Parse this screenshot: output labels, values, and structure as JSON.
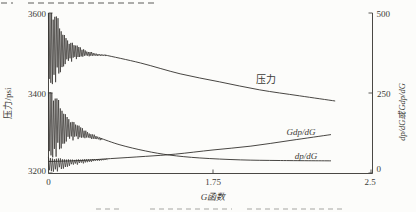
{
  "page": {
    "top_text_fragment": "…",
    "caption_fragment": "…"
  },
  "colors": {
    "line": "#33312e",
    "axis": "#4a4844",
    "text": "#3b3a36",
    "background": "#fcfcfa"
  },
  "chart_data": {
    "type": "line",
    "title": "",
    "xlabel": "G函数",
    "ylabel_left": "压力/psi",
    "ylabel_right": "dp/dG或Gdp/dG",
    "grid": false,
    "legend": "inline-labels",
    "x_range": [
      0,
      2.5
    ],
    "x_ticks": [
      "0",
      "1.75",
      "2.5"
    ],
    "x_tick_values": [
      0,
      1.75,
      2.5
    ],
    "left_axis": {
      "ticks": [
        "3600",
        "3400",
        "3200"
      ],
      "tick_values": [
        3600,
        3400,
        3200
      ],
      "range": [
        3200,
        3600
      ]
    },
    "right_axis": {
      "ticks": [
        "500",
        "250",
        "0"
      ],
      "tick_values": [
        500,
        250,
        0
      ],
      "range": [
        0,
        500
      ]
    },
    "series": [
      {
        "name": "压力",
        "axis": "left",
        "noisy_start": true,
        "x": [
          0.6,
          0.98,
          1.4,
          1.78,
          1.97,
          2.16,
          2.33
        ],
        "y": [
          3495,
          3475,
          3448,
          3428,
          3408,
          3393,
          3380
        ]
      },
      {
        "name": "dp/dG",
        "axis": "right",
        "noisy_start": true,
        "x": [
          0.55,
          0.76,
          1.03,
          1.29,
          1.61,
          1.88,
          2.07,
          2.31
        ],
        "y": [
          109,
          88,
          69,
          56,
          47,
          41,
          39,
          38
        ]
      },
      {
        "name": "Gdp/dG",
        "axis": "right",
        "noisy_start": true,
        "x": [
          0,
          0.34,
          0.66,
          1.03,
          1.35,
          1.75,
          1.93,
          2.12,
          2.31
        ],
        "y": [
          36,
          39,
          45,
          52,
          59,
          72,
          84,
          102,
          120
        ]
      }
    ]
  }
}
